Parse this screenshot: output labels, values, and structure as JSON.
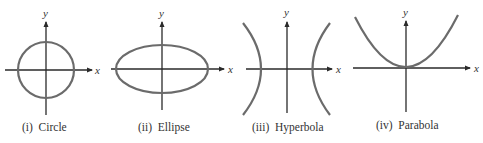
{
  "figure": {
    "panels": [
      {
        "id": "circle",
        "caption": "(i)  Circle",
        "x_label": "x",
        "y_label": "y"
      },
      {
        "id": "ellipse",
        "caption": "(ii)  Ellipse",
        "x_label": "x",
        "y_label": "y"
      },
      {
        "id": "hyperbola",
        "caption": "(iii)  Hyperbola",
        "x_label": "x",
        "y_label": "y"
      },
      {
        "id": "parabola",
        "caption": "(iv)  Parabola",
        "x_label": "x",
        "y_label": "y"
      }
    ],
    "colors": {
      "axis": "#2a2a2a",
      "curve": "#6b6b6b",
      "text": "#333333"
    }
  }
}
